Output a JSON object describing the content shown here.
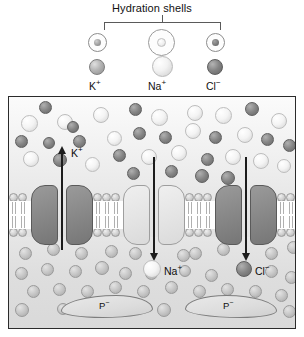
{
  "figure": {
    "title": "Hydration shells",
    "legend": {
      "items": [
        {
          "label": "K",
          "charge": "+",
          "shell": "tight-small-shell",
          "ion_color": "#b5b5b5"
        },
        {
          "label": "Na",
          "charge": "+",
          "shell": "large-loose-shell",
          "ion_color": "#f2f2f2"
        },
        {
          "label": "Cl",
          "charge": "−",
          "shell": "tight-small-shell",
          "ion_color": "#848484"
        }
      ]
    },
    "diagram": {
      "channels": [
        {
          "ion": "K",
          "charge": "+",
          "direction": "out",
          "shade": "dark",
          "label": "K"
        },
        {
          "ion": "Na",
          "charge": "+",
          "direction": "in",
          "shade": "light",
          "label": "Na"
        },
        {
          "ion": "Cl",
          "charge": "−",
          "direction": "in",
          "shade": "dark",
          "label": "Cl"
        }
      ],
      "channel_labels": {
        "k": "K",
        "k_charge": "+",
        "na": "Na",
        "na_charge": "+",
        "cl": "Cl",
        "cl_charge": "−"
      },
      "proteins": [
        {
          "label": "P",
          "charge": "−"
        },
        {
          "label": "P",
          "charge": "−"
        }
      ],
      "regions": {
        "extracellular": "extracellular-fluid",
        "membrane": "phospholipid-bilayer",
        "intracellular": "cytosol"
      }
    },
    "colors": {
      "outline": "#2b2b2b",
      "channel_dark": "#868686",
      "channel_light": "#e4e4e4",
      "arrow": "#1c1c1c"
    }
  }
}
